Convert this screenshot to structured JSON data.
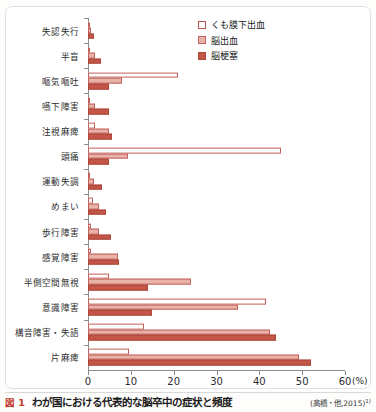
{
  "figure": {
    "number_label": "図 1",
    "caption": "わが国における代表的な脳卒中の症状と頻度",
    "source": "(高橋・他,2015)",
    "source_superscript": "1)"
  },
  "legend": {
    "position": "top-right",
    "items": [
      {
        "label": "くも膜下出血",
        "swatch": "open-square-swatch",
        "color": "#ffffff",
        "border": "#b8564f"
      },
      {
        "label": "脳出血",
        "swatch": "light-pink-square-swatch",
        "color": "#e9b3a9",
        "border": "#c0605a"
      },
      {
        "label": "脳梗塞",
        "swatch": "dark-terracotta-square-swatch",
        "color": "#c45648",
        "border": "#ab4639"
      }
    ]
  },
  "axis": {
    "x_unit": "(%)",
    "x_ticks": [
      0,
      10,
      20,
      30,
      40,
      50,
      60
    ],
    "x_tick_labels": [
      "0",
      "10",
      "20",
      "30",
      "40",
      "50",
      "60"
    ]
  },
  "chart_data": {
    "type": "bar",
    "orientation": "horizontal",
    "title": "わが国における代表的な脳卒中の症状と頻度",
    "xlabel": "(%)",
    "ylabel": "",
    "xlim": [
      0,
      60
    ],
    "grid": false,
    "legend_position": "top-right",
    "categories": [
      "失認失行",
      "半盲",
      "嘔気嘔吐",
      "嚥下障害",
      "注視麻痺",
      "頭痛",
      "運動失調",
      "めまい",
      "歩行障害",
      "感覚障害",
      "半側空間無視",
      "意識障害",
      "構音障害・失語",
      "片麻痺"
    ],
    "series": [
      {
        "name": "くも膜下出血",
        "color": "#ffffff",
        "border": "#c0605a",
        "values": [
          0.3,
          0.4,
          21.0,
          0.4,
          1.6,
          45.0,
          0.3,
          1.2,
          0.6,
          0.6,
          5.0,
          41.5,
          13.0,
          9.5
        ]
      },
      {
        "name": "脳出血",
        "color": "#e9b3a9",
        "border": "#c0605a",
        "values": [
          0.7,
          1.6,
          8.0,
          1.6,
          5.0,
          9.3,
          1.3,
          2.6,
          2.6,
          7.0,
          24.0,
          35.0,
          42.5,
          49.3
        ]
      },
      {
        "name": "脳梗塞",
        "color": "#c45648",
        "border": "#ab4639",
        "values": [
          1.5,
          3.0,
          5.0,
          5.0,
          5.5,
          5.0,
          3.3,
          4.2,
          5.4,
          7.3,
          14.0,
          15.0,
          44.0,
          52.0
        ]
      }
    ]
  }
}
